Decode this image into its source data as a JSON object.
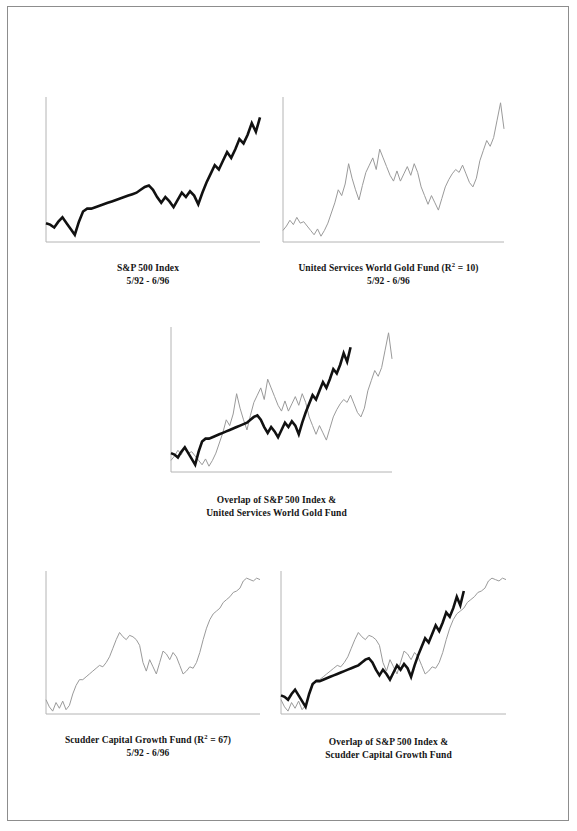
{
  "page": {
    "background": "#ffffff",
    "border_color": "#8d8d8d"
  },
  "colors": {
    "sp500_line": "#111111",
    "fund_line": "#9a9a9a",
    "axis": "#b4b4b4",
    "text": "#151515"
  },
  "figures": [
    {
      "id": "sp500",
      "caption_line1": "S&P 500 Index",
      "caption_line2": "5/92 - 6/96"
    },
    {
      "id": "gold",
      "caption_line1_pre": "United Services World Gold Fund (R",
      "caption_line1_sup": "2",
      "caption_line1_post": " = 10)",
      "caption_line2": "5/92 - 6/96"
    },
    {
      "id": "overlap_gold",
      "caption_line1": "Overlap of S&P 500 Index &",
      "caption_line2": "United Services World Gold Fund"
    },
    {
      "id": "scudder",
      "caption_line1_pre": "Scudder Capital Growth Fund (R",
      "caption_line1_sup": "2",
      "caption_line1_post": " = 67)",
      "caption_line2": "5/92 - 6/96"
    },
    {
      "id": "overlap_scudder",
      "caption_line1": "Overlap of S&P 500 Index &",
      "caption_line2": "Scudder Capital Growth Fund"
    }
  ],
  "chart_data": [
    {
      "type": "line",
      "id": "sp500",
      "title": "S&P 500 Index",
      "subtitle": "5/92 - 6/96",
      "xlabel": "",
      "ylabel": "",
      "grid": false,
      "legend": "none",
      "axes": {
        "left": true,
        "bottom": true
      },
      "xlim": [
        0,
        52
      ],
      "ylim": [
        0,
        100
      ],
      "series": [
        {
          "name": "S&P 500 Index",
          "color": "#111111",
          "width": 2.6,
          "x": [
            0,
            1,
            2,
            3,
            4,
            5,
            6,
            7,
            8,
            9,
            10,
            11,
            12,
            13,
            14,
            15,
            16,
            17,
            18,
            19,
            20,
            21,
            22,
            23,
            24,
            25,
            26,
            27,
            28,
            29,
            30,
            31,
            32,
            33,
            34,
            35,
            36,
            37,
            38,
            39,
            40,
            41,
            42,
            43,
            44,
            45,
            46,
            47,
            48,
            49,
            50,
            51,
            52
          ],
          "values": [
            13,
            12,
            10,
            14,
            17,
            13,
            9,
            5,
            14,
            21,
            23,
            23,
            24,
            25,
            26,
            27,
            28,
            29,
            30,
            31,
            32,
            33,
            34,
            36,
            38,
            39,
            36,
            31,
            27,
            31,
            28,
            24,
            29,
            34,
            31,
            35,
            32,
            26,
            34,
            41,
            47,
            53,
            50,
            56,
            62,
            58,
            64,
            71,
            68,
            74,
            82,
            76,
            86
          ]
        }
      ]
    },
    {
      "type": "line",
      "id": "gold",
      "title": "United Services World Gold Fund (R2 = 10)",
      "subtitle": "5/92 - 6/96",
      "r_squared": 10,
      "grid": false,
      "legend": "none",
      "axes": {
        "left": true,
        "bottom": true
      },
      "xlim": [
        0,
        64
      ],
      "ylim": [
        0,
        100
      ],
      "series": [
        {
          "name": "United Services World Gold Fund",
          "color": "#9a9a9a",
          "width": 1.0,
          "x": [
            0,
            1,
            2,
            3,
            4,
            5,
            6,
            7,
            8,
            9,
            10,
            11,
            12,
            13,
            14,
            15,
            16,
            17,
            18,
            19,
            20,
            21,
            22,
            23,
            24,
            25,
            26,
            27,
            28,
            29,
            30,
            31,
            32,
            33,
            34,
            35,
            36,
            37,
            38,
            39,
            40,
            41,
            42,
            43,
            44,
            45,
            46,
            47,
            48,
            49,
            50,
            51,
            52,
            53,
            54,
            55,
            56,
            57,
            58,
            59,
            60,
            61,
            62,
            63,
            64
          ],
          "values": [
            8,
            11,
            15,
            12,
            17,
            13,
            14,
            11,
            8,
            5,
            9,
            4,
            8,
            13,
            20,
            27,
            36,
            32,
            40,
            54,
            44,
            36,
            29,
            39,
            48,
            53,
            58,
            50,
            64,
            58,
            52,
            46,
            42,
            49,
            42,
            47,
            52,
            46,
            54,
            48,
            38,
            32,
            26,
            32,
            27,
            22,
            30,
            38,
            43,
            47,
            50,
            48,
            53,
            47,
            41,
            38,
            44,
            56,
            63,
            70,
            66,
            72,
            84,
            96,
            78
          ]
        }
      ]
    },
    {
      "type": "line",
      "id": "overlap_gold",
      "title": "Overlap of S&P 500 Index & United Services World Gold Fund",
      "grid": false,
      "legend": "none",
      "axes": {
        "left": true,
        "bottom": true
      },
      "xlim": [
        0,
        64
      ],
      "ylim": [
        0,
        100
      ],
      "series": [
        {
          "name": "United Services World Gold Fund",
          "color": "#9a9a9a",
          "width": 1.0,
          "x": [
            0,
            1,
            2,
            3,
            4,
            5,
            6,
            7,
            8,
            9,
            10,
            11,
            12,
            13,
            14,
            15,
            16,
            17,
            18,
            19,
            20,
            21,
            22,
            23,
            24,
            25,
            26,
            27,
            28,
            29,
            30,
            31,
            32,
            33,
            34,
            35,
            36,
            37,
            38,
            39,
            40,
            41,
            42,
            43,
            44,
            45,
            46,
            47,
            48,
            49,
            50,
            51,
            52,
            53,
            54,
            55,
            56,
            57,
            58,
            59,
            60,
            61,
            62,
            63,
            64
          ],
          "values": [
            8,
            11,
            15,
            12,
            17,
            13,
            14,
            11,
            8,
            5,
            9,
            4,
            8,
            13,
            20,
            27,
            36,
            32,
            40,
            54,
            44,
            36,
            29,
            39,
            48,
            53,
            58,
            50,
            64,
            58,
            52,
            46,
            42,
            49,
            42,
            47,
            52,
            46,
            54,
            48,
            38,
            32,
            26,
            32,
            27,
            22,
            30,
            38,
            43,
            47,
            50,
            48,
            53,
            47,
            41,
            38,
            44,
            56,
            63,
            70,
            66,
            72,
            84,
            96,
            78
          ]
        },
        {
          "name": "S&P 500 Index",
          "color": "#111111",
          "width": 2.6,
          "x": [
            0,
            1,
            2,
            3,
            4,
            5,
            6,
            7,
            8,
            9,
            10,
            11,
            12,
            13,
            14,
            15,
            16,
            17,
            18,
            19,
            20,
            21,
            22,
            23,
            24,
            25,
            26,
            27,
            28,
            29,
            30,
            31,
            32,
            33,
            34,
            35,
            36,
            37,
            38,
            39,
            40,
            41,
            42,
            43,
            44,
            45,
            46,
            47,
            48,
            49,
            50,
            51,
            52
          ],
          "values": [
            13,
            12,
            10,
            14,
            17,
            13,
            9,
            5,
            14,
            21,
            23,
            23,
            24,
            25,
            26,
            27,
            28,
            29,
            30,
            31,
            32,
            33,
            34,
            36,
            38,
            39,
            36,
            31,
            27,
            31,
            28,
            24,
            29,
            34,
            31,
            35,
            32,
            26,
            34,
            41,
            47,
            53,
            50,
            56,
            62,
            58,
            64,
            71,
            68,
            74,
            82,
            76,
            86
          ]
        }
      ]
    },
    {
      "type": "line",
      "id": "scudder",
      "title": "Scudder Capital Growth Fund (R2 = 67)",
      "subtitle": "5/92 - 6/96",
      "r_squared": 67,
      "grid": false,
      "legend": "none",
      "axes": {
        "left": true,
        "bottom": true
      },
      "xlim": [
        0,
        64
      ],
      "ylim": [
        0,
        100
      ],
      "series": [
        {
          "name": "Scudder Capital Growth Fund",
          "color": "#9a9a9a",
          "width": 1.0,
          "x": [
            0,
            1,
            2,
            3,
            4,
            5,
            6,
            7,
            8,
            9,
            10,
            11,
            12,
            13,
            14,
            15,
            16,
            17,
            18,
            19,
            20,
            21,
            22,
            23,
            24,
            25,
            26,
            27,
            28,
            29,
            30,
            31,
            32,
            33,
            34,
            35,
            36,
            37,
            38,
            39,
            40,
            41,
            42,
            43,
            44,
            45,
            46,
            47,
            48,
            49,
            50,
            51,
            52,
            53,
            54,
            55,
            56,
            57,
            58,
            59,
            60,
            61,
            62,
            63,
            64
          ],
          "values": [
            10,
            5,
            2,
            8,
            4,
            9,
            3,
            6,
            14,
            20,
            24,
            24,
            26,
            28,
            30,
            32,
            34,
            33,
            36,
            40,
            46,
            52,
            57,
            54,
            52,
            55,
            54,
            52,
            48,
            36,
            30,
            38,
            33,
            28,
            36,
            44,
            42,
            38,
            43,
            40,
            34,
            28,
            30,
            33,
            32,
            36,
            43,
            52,
            60,
            66,
            70,
            72,
            74,
            78,
            80,
            82,
            85,
            86,
            88,
            93,
            95,
            94,
            93,
            95,
            94
          ]
        }
      ]
    },
    {
      "type": "line",
      "id": "overlap_scudder",
      "title": "Overlap of S&P 500 Index & Scudder Capital Growth Fund",
      "grid": false,
      "legend": "none",
      "axes": {
        "left": true,
        "bottom": true
      },
      "xlim": [
        0,
        64
      ],
      "ylim": [
        0,
        100
      ],
      "series": [
        {
          "name": "Scudder Capital Growth Fund",
          "color": "#9a9a9a",
          "width": 1.0,
          "x": [
            0,
            1,
            2,
            3,
            4,
            5,
            6,
            7,
            8,
            9,
            10,
            11,
            12,
            13,
            14,
            15,
            16,
            17,
            18,
            19,
            20,
            21,
            22,
            23,
            24,
            25,
            26,
            27,
            28,
            29,
            30,
            31,
            32,
            33,
            34,
            35,
            36,
            37,
            38,
            39,
            40,
            41,
            42,
            43,
            44,
            45,
            46,
            47,
            48,
            49,
            50,
            51,
            52,
            53,
            54,
            55,
            56,
            57,
            58,
            59,
            60,
            61,
            62,
            63,
            64
          ],
          "values": [
            10,
            5,
            2,
            8,
            4,
            9,
            3,
            6,
            14,
            20,
            24,
            24,
            26,
            28,
            30,
            32,
            34,
            33,
            36,
            40,
            46,
            52,
            57,
            54,
            52,
            55,
            54,
            52,
            48,
            36,
            30,
            38,
            33,
            28,
            36,
            44,
            42,
            38,
            43,
            40,
            34,
            28,
            30,
            33,
            32,
            36,
            43,
            52,
            60,
            66,
            70,
            72,
            74,
            78,
            80,
            82,
            85,
            86,
            88,
            93,
            95,
            94,
            93,
            95,
            94
          ]
        },
        {
          "name": "S&P 500 Index",
          "color": "#111111",
          "width": 2.6,
          "x": [
            0,
            1,
            2,
            3,
            4,
            5,
            6,
            7,
            8,
            9,
            10,
            11,
            12,
            13,
            14,
            15,
            16,
            17,
            18,
            19,
            20,
            21,
            22,
            23,
            24,
            25,
            26,
            27,
            28,
            29,
            30,
            31,
            32,
            33,
            34,
            35,
            36,
            37,
            38,
            39,
            40,
            41,
            42,
            43,
            44,
            45,
            46,
            47,
            48,
            49,
            50,
            51,
            52
          ],
          "values": [
            13,
            12,
            10,
            14,
            17,
            13,
            9,
            5,
            14,
            21,
            23,
            23,
            24,
            25,
            26,
            27,
            28,
            29,
            30,
            31,
            32,
            33,
            34,
            36,
            38,
            39,
            36,
            31,
            27,
            31,
            28,
            24,
            29,
            34,
            31,
            35,
            32,
            26,
            34,
            41,
            47,
            53,
            50,
            56,
            62,
            58,
            64,
            71,
            68,
            74,
            82,
            76,
            86
          ]
        }
      ]
    }
  ]
}
